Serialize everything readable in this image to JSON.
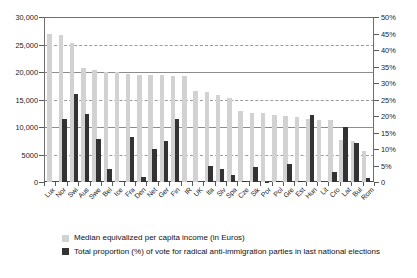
{
  "chart_data": {
    "type": "bar",
    "title": "",
    "subtitle": "",
    "xlabel": "",
    "ylabel": "",
    "y2label": "",
    "grid": true,
    "legend_position": "bottom-left",
    "categories": [
      "Lux",
      "Nor",
      "Swi",
      "Aus",
      "Swe",
      "Bel",
      "Ice",
      "Fra",
      "Den",
      "Net",
      "Ger",
      "Fin",
      "IR",
      "UK",
      "Ita",
      "Slv",
      "Spa",
      "Cze",
      "Slk",
      "Por",
      "Pol",
      "Gre",
      "Est",
      "Hun",
      "Lit",
      "Cro",
      "Lat",
      "Bul",
      "Rom"
    ],
    "axes": {
      "left": {
        "min": 0,
        "max": 30000,
        "step": 5000,
        "ticks": [
          "0",
          "5000",
          "10,000",
          "15,000",
          "20,000",
          "25,000",
          "30,000"
        ],
        "unit": "Euros"
      },
      "right": {
        "min": 0,
        "max": 50,
        "step": 5,
        "ticks": [
          "0",
          "5%",
          "10%",
          "15%",
          "20%",
          "25%",
          "30%",
          "35%",
          "40%",
          "45%",
          "50%"
        ],
        "unit": "percent"
      }
    },
    "series": [
      {
        "name": "Median equivalized per capita income (in Euros)",
        "axis": "left",
        "color": "#d2d2d2",
        "values": [
          27000,
          26800,
          25300,
          20700,
          20300,
          20000,
          20000,
          19600,
          19500,
          19500,
          19400,
          19300,
          19200,
          16500,
          16300,
          15900,
          15200,
          13000,
          12600,
          12500,
          12200,
          12000,
          11800,
          11500,
          11300,
          11200,
          7600,
          7500,
          5700
        ]
      },
      {
        "name": "Total proportion (%) of vote for radical anti-immigration parties in last national elections",
        "axis": "right",
        "color": "#333333",
        "values": [
          0,
          19.1,
          26.6,
          20.5,
          13.0,
          3.9,
          0,
          13.6,
          1.5,
          10.0,
          12.4,
          19.1,
          0,
          0,
          4.9,
          4.0,
          2.0,
          0.3,
          4.5,
          0.1,
          0.3,
          5.6,
          0.2,
          20.3,
          0,
          2.9,
          16.6,
          11.7,
          1.3
        ]
      }
    ],
    "legend": [
      {
        "label": "Median equivalized per capita income (in Euros)",
        "color": "#d2d2d2"
      },
      {
        "label": "Total proportion (%) of vote for radical anti-immigration parties in last national elections",
        "color": "#333333"
      }
    ]
  }
}
